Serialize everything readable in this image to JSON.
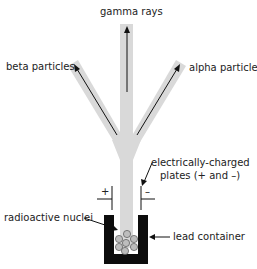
{
  "diagram": {
    "labels": {
      "gamma": "gamma rays",
      "beta": "beta particles",
      "alpha": "alpha particles",
      "plates_line1": "electrically-charged",
      "plates_line2": "plates (+ and –)",
      "plus": "+",
      "minus": "–",
      "nuclei": "radioactive nuclei",
      "container": "lead container"
    },
    "colors": {
      "beam": "#d9d9d9",
      "arrow": "#111111",
      "container": "#0d0d0d",
      "nucleus": "#bdbdbd"
    }
  }
}
